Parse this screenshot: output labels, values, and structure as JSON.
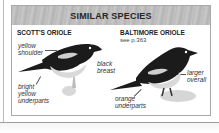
{
  "panel": {
    "title": "SIMILAR SPECIES",
    "species": [
      {
        "name": "SCOTT'S ORIOLE",
        "reference": "",
        "labels": [
          {
            "lines": [
              "yellow",
              "shoulder"
            ]
          },
          {
            "lines": [
              "bright",
              "yellow",
              "underparts"
            ]
          }
        ]
      },
      {
        "name": "BALTIMORE ORIOLE",
        "reference": "see p.363",
        "labels": [
          {
            "lines": [
              "black",
              "breast"
            ]
          },
          {
            "lines": [
              "larger",
              "overall"
            ]
          },
          {
            "lines": [
              "orange",
              "underparts"
            ]
          }
        ]
      }
    ]
  },
  "colors": {
    "header_bg": "#bdbdbd",
    "border": "#a9a9a9",
    "bird_dark": "#1a1a1a",
    "bird_light": "#d9d9d9"
  }
}
